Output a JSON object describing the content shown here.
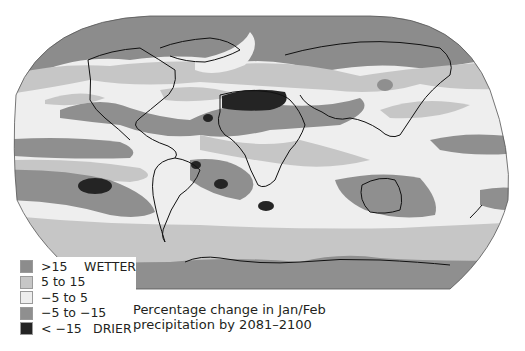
{
  "map": {
    "projection": "Robinson",
    "colors": {
      "much_wetter": "#8c8c8c",
      "wetter": "#c6c6c6",
      "neutral": "#eeeeee",
      "drier": "#8f8f8f",
      "much_drier": "#242424",
      "coastline": "#111111",
      "outline": "#555555"
    }
  },
  "legend": {
    "items": [
      {
        "label": ">15",
        "tag": "WETTER",
        "color": "#8c8c8c"
      },
      {
        "label": "5 to 15",
        "tag": "",
        "color": "#c6c6c6"
      },
      {
        "label": "−5 to 5",
        "tag": "",
        "color": "#eeeeee"
      },
      {
        "label": "−5 to −15",
        "tag": "",
        "color": "#8f8f8f"
      },
      {
        "label": "< −15",
        "tag": "DRIER",
        "color": "#242424"
      }
    ]
  },
  "caption": {
    "line1": "Percentage change in Jan/Feb",
    "line2": "precipitation by 2081–2100"
  }
}
